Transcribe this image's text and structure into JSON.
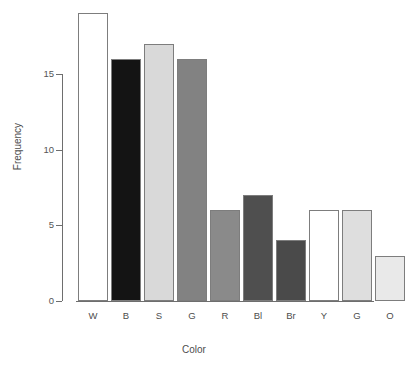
{
  "chart_data": {
    "type": "bar",
    "title": "",
    "xlabel": "Color",
    "ylabel": "Frequency",
    "categories": [
      "W",
      "B",
      "S",
      "G",
      "R",
      "Bl",
      "Br",
      "Y",
      "G",
      "O"
    ],
    "values": [
      19,
      16,
      17,
      16,
      6,
      7,
      4,
      6,
      6,
      3
    ],
    "bar_colors": [
      "#ffffff",
      "#141414",
      "#d9d9d9",
      "#828282",
      "#8a8a8a",
      "#4f4f4f",
      "#4a4a4a",
      "#ffffff",
      "#dedede",
      "#e9e9e9"
    ],
    "bar_border_color": "#7d7d7d",
    "ylim": [
      0,
      19.5
    ],
    "ytick_labels": [
      "0",
      "5",
      "10",
      "15"
    ],
    "ytick_values": [
      0,
      5,
      10,
      15
    ],
    "grid": false,
    "legend": null,
    "background": "#ffffff"
  },
  "axis": {
    "y_title": "Frequency",
    "x_title": "Color"
  }
}
